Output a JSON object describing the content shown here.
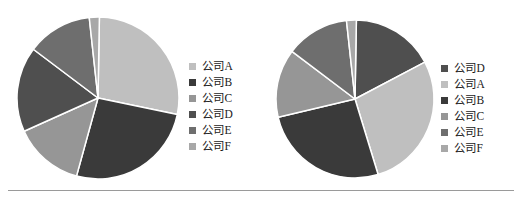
{
  "page": {
    "background_color": "#FFFFFF",
    "divider_color": "#9A9A9A"
  },
  "palette": {
    "company_a": "#BFBFBF",
    "company_b": "#3A3A3A",
    "company_c": "#969696",
    "company_d": "#4F4F4F",
    "company_e": "#6E6E6E",
    "company_f": "#A8A8A8",
    "slice_border": "#FFFFFF"
  },
  "charts": [
    {
      "id": "chart-1",
      "legend_position": "right",
      "legend": [
        {
          "label": "公司A",
          "color": "#BFBFBF"
        },
        {
          "label": "公司B",
          "color": "#3A3A3A"
        },
        {
          "label": "公司C",
          "color": "#969696"
        },
        {
          "label": "公司D",
          "color": "#4F4F4F"
        },
        {
          "label": "公司E",
          "color": "#6E6E6E"
        },
        {
          "label": "公司F",
          "color": "#A8A8A8"
        }
      ]
    },
    {
      "id": "chart-2",
      "legend_position": "right",
      "legend": [
        {
          "label": "公司D",
          "color": "#4F4F4F"
        },
        {
          "label": "公司A",
          "color": "#BFBFBF"
        },
        {
          "label": "公司B",
          "color": "#3A3A3A"
        },
        {
          "label": "公司C",
          "color": "#969696"
        },
        {
          "label": "公司E",
          "color": "#6E6E6E"
        },
        {
          "label": "公司F",
          "color": "#A8A8A8"
        }
      ]
    }
  ],
  "chart_data": [
    {
      "type": "pie",
      "title": "",
      "labels": [
        "公司A",
        "公司B",
        "公司C",
        "公司D",
        "公司E",
        "公司F"
      ],
      "values": [
        28,
        26,
        14,
        17,
        13,
        2
      ],
      "colors": [
        "#BFBFBF",
        "#3A3A3A",
        "#969696",
        "#4F4F4F",
        "#6E6E6E",
        "#A8A8A8"
      ],
      "start_angle_deg": 1,
      "direction": "clockwise",
      "legend": "right",
      "center_px": [
        96,
        96
      ],
      "radius_px": 81,
      "slice_border_color": "#FFFFFF",
      "slice_border_width_px": 1.5
    },
    {
      "type": "pie",
      "title": "",
      "labels": [
        "公司D",
        "公司A",
        "公司B",
        "公司C",
        "公司E",
        "公司F"
      ],
      "values": [
        17,
        28,
        26,
        14,
        13,
        2
      ],
      "colors": [
        "#4F4F4F",
        "#BFBFBF",
        "#3A3A3A",
        "#969696",
        "#6E6E6E",
        "#A8A8A8"
      ],
      "start_angle_deg": 1,
      "direction": "clockwise",
      "legend": "right",
      "center_px": [
        92,
        97
      ],
      "radius_px": 79,
      "slice_border_color": "#FFFFFF",
      "slice_border_width_px": 1.5
    }
  ]
}
